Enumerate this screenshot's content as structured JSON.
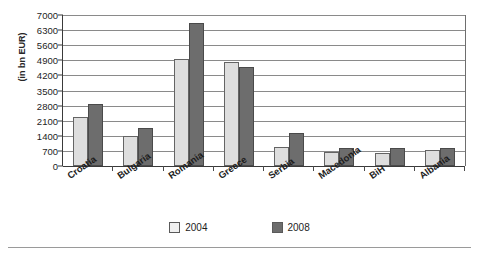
{
  "chart_data": {
    "type": "bar",
    "title": "",
    "subtitle": "",
    "xlabel": "",
    "ylabel": "(in bn EUR)",
    "categories": [
      "Croatia",
      "Bulgaria",
      "Romania",
      "Greece",
      "Serbia",
      "Macedonia",
      "BiH",
      "Albania"
    ],
    "series": [
      {
        "name": "2004",
        "values": [
          2250,
          1380,
          4950,
          4800,
          870,
          640,
          620,
          740
        ]
      },
      {
        "name": "2008",
        "values": [
          2880,
          1740,
          6650,
          4600,
          1520,
          830,
          820,
          840
        ]
      }
    ],
    "ylim": [
      0,
      7000
    ],
    "yticks": [
      0,
      700,
      1400,
      2100,
      2800,
      3500,
      4200,
      4900,
      5600,
      6300,
      7000
    ],
    "ytick_labels": [
      "0",
      "700",
      "1400",
      "2100",
      "2800",
      "3500",
      "4200",
      "4900",
      "5600",
      "6300",
      "7000"
    ],
    "grid": true,
    "legend_position": "bottom",
    "colors": {
      "2004": "#dedede",
      "2008": "#6d6d6d",
      "grid": "#8a8a8a",
      "axis": "#3a3a3a"
    }
  }
}
